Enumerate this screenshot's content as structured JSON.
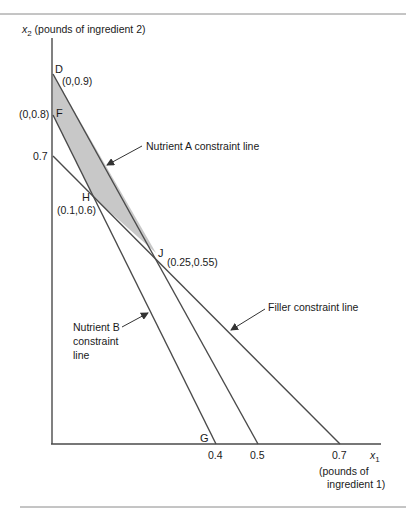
{
  "diagram": {
    "title_axis_y": {
      "var": "x",
      "sub": "2",
      "text": " (pounds of ingredient 2)"
    },
    "title_axis_x": {
      "var": "x",
      "sub": "1",
      "line1": "(pounds of",
      "line2": "ingredient 1)"
    },
    "x_ticks": [
      "0.4",
      "0.5",
      "0.7"
    ],
    "y_ticks": [
      "(0,0.8)",
      "0.7"
    ],
    "points": [
      {
        "name": "D",
        "coord": "(0,0.9)",
        "x": 0,
        "y": 0.9
      },
      {
        "name": "F",
        "coord": "(0,0.8)",
        "x": 0,
        "y": 0.8
      },
      {
        "name": "H",
        "coord": "(0.1,0.6)",
        "x": 0.1,
        "y": 0.6
      },
      {
        "name": "J",
        "coord": "(0.25,0.55)",
        "x": 0.25,
        "y": 0.55
      },
      {
        "name": "G",
        "coord": "",
        "x": 0.4,
        "y": 0
      }
    ],
    "constraints": [
      {
        "name": "Nutrient A constraint line",
        "from": [
          0,
          0.9
        ],
        "to": [
          0.5,
          0
        ]
      },
      {
        "name": "Nutrient B constraint line",
        "from": [
          0,
          0.8
        ],
        "to": [
          0.4,
          0
        ]
      },
      {
        "name": "Filler constraint line",
        "from": [
          0,
          0.7
        ],
        "to": [
          0.7,
          0
        ]
      }
    ],
    "labels": {
      "nutrient_a": "Nutrient A constraint line",
      "nutrient_b_1": "Nutrient B",
      "nutrient_b_2": "constraint",
      "nutrient_b_3": "line",
      "filler": "Filler constraint line"
    },
    "feasible_region": [
      "D",
      "F",
      "H",
      "J"
    ],
    "colors": {
      "line": "#4a4a4a",
      "region_fill": "#c8c8c8",
      "rule": "#8a8a8a"
    }
  }
}
